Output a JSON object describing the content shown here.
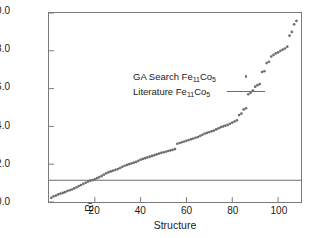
{
  "chart_data": {
    "type": "scatter",
    "title": "",
    "xlabel": "Structure",
    "ylabel": "Relative Formation Energy (meV/atom)",
    "xlim": [
      0,
      110
    ],
    "ylim": [
      0.0,
      10.0
    ],
    "xticks": [
      20,
      40,
      60,
      80,
      100
    ],
    "xtick_labels": [
      "20",
      "40",
      "60",
      "80",
      "100"
    ],
    "yticks": [
      0.0,
      2.0,
      4.0,
      6.0,
      8.0,
      10.0
    ],
    "ytick_labels": [
      "0.0",
      "2.0",
      "4.0",
      "6.0",
      "8.0",
      "10.0"
    ],
    "grid": false,
    "legend_position": "upper-left-inside",
    "marker_color": "#6e6e6e",
    "line_color": "#6b6b6b",
    "axis_color": "#7a7a7a",
    "series": [
      {
        "name": "GA Search Fe11Co5",
        "name_html": "GA Search Fe<sub>11</sub>Co<sub>5</sub>",
        "marker": "dot",
        "x": [
          1,
          2,
          3,
          4,
          5,
          6,
          7,
          8,
          9,
          10,
          11,
          12,
          13,
          14,
          15,
          16,
          17,
          18,
          19,
          20,
          21,
          22,
          23,
          24,
          25,
          26,
          27,
          28,
          29,
          30,
          31,
          32,
          33,
          34,
          35,
          36,
          37,
          38,
          39,
          40,
          41,
          42,
          43,
          44,
          45,
          46,
          47,
          48,
          49,
          50,
          51,
          52,
          53,
          54,
          55,
          56,
          57,
          58,
          59,
          60,
          61,
          62,
          63,
          64,
          65,
          66,
          67,
          68,
          69,
          70,
          71,
          72,
          73,
          74,
          75,
          76,
          77,
          78,
          79,
          80,
          81,
          82,
          83,
          84,
          85,
          86,
          87,
          88,
          89,
          90,
          91,
          92,
          93,
          94,
          95,
          96,
          97,
          98,
          99,
          100,
          101,
          102,
          103,
          104,
          105,
          106,
          107,
          108
        ],
        "y": [
          0.22,
          0.3,
          0.34,
          0.4,
          0.44,
          0.48,
          0.52,
          0.58,
          0.62,
          0.66,
          0.72,
          0.78,
          0.84,
          0.9,
          0.96,
          1.02,
          1.08,
          1.13,
          1.16,
          1.2,
          1.26,
          1.32,
          1.38,
          1.45,
          1.52,
          1.58,
          1.62,
          1.66,
          1.7,
          1.74,
          1.8,
          1.86,
          1.92,
          1.96,
          2.0,
          2.04,
          2.08,
          2.12,
          2.18,
          2.24,
          2.28,
          2.32,
          2.36,
          2.4,
          2.44,
          2.48,
          2.52,
          2.56,
          2.6,
          2.63,
          2.66,
          2.7,
          2.73,
          2.76,
          2.8,
          3.08,
          3.12,
          3.16,
          3.2,
          3.24,
          3.28,
          3.32,
          3.36,
          3.4,
          3.44,
          3.5,
          3.56,
          3.62,
          3.66,
          3.7,
          3.74,
          3.78,
          3.84,
          3.9,
          3.96,
          4.0,
          4.04,
          4.08,
          4.14,
          4.2,
          4.26,
          4.32,
          4.6,
          4.68,
          4.9,
          4.96,
          5.7,
          5.78,
          5.9,
          6.1,
          6.18,
          6.24,
          6.88,
          6.92,
          7.35,
          7.42,
          7.7,
          7.78,
          7.86,
          7.92,
          8.0,
          8.06,
          8.12,
          8.22,
          8.8,
          9.0,
          9.4,
          9.58
        ]
      },
      {
        "name": "Literature Fe11Co5",
        "name_html": "Literature Fe<sub>11</sub>Co<sub>5</sub>",
        "marker": "line",
        "type": "hline",
        "value": 1.15
      }
    ],
    "annotations": []
  },
  "legend": {
    "items": [
      {
        "label_html": "GA Search Fe<sub>11</sub>Co<sub>5</sub>",
        "key": "dot-marker"
      },
      {
        "label_html": "Literature Fe<sub>11</sub>Co<sub>5</sub>",
        "key": "line-marker"
      }
    ]
  }
}
